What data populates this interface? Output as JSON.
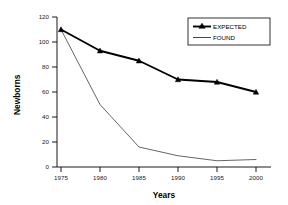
{
  "chart_data": {
    "type": "line",
    "title": "",
    "xlabel": "Years",
    "ylabel": "Newborns",
    "x": [
      1975,
      1980,
      1985,
      1990,
      1995,
      2000
    ],
    "xtick_labels": [
      "1975",
      "1980",
      "1985",
      "1990",
      "1995",
      "2000"
    ],
    "ytick_labels": [
      "0",
      "20",
      "40",
      "60",
      "80",
      "100",
      "120"
    ],
    "yticks": [
      0,
      20,
      40,
      60,
      80,
      100,
      120
    ],
    "xlim": [
      1973,
      2002
    ],
    "ylim": [
      0,
      120
    ],
    "grid": false,
    "legend_position": "top-right",
    "series": [
      {
        "name": "EXPECTED",
        "values": [
          110,
          93,
          85,
          70,
          68,
          60
        ],
        "marker": "triangle",
        "line_width": "thick",
        "color": "#000000"
      },
      {
        "name": "FOUND",
        "values": [
          110,
          50,
          16,
          9,
          5,
          6
        ],
        "marker": "none",
        "line_width": "thin",
        "color": "#333333"
      }
    ],
    "legend_entries": [
      "EXPECTED",
      "FOUND"
    ]
  },
  "figure": {
    "background_color": "#ffffff",
    "axis_color": "#000000"
  }
}
